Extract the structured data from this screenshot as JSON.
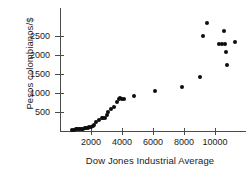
{
  "chart_data": {
    "type": "scatter",
    "title": "",
    "xlabel": "Dow Jones Industrial Average",
    "ylabel": "Pesos colombianos/$",
    "xlim": [
      0,
      12000
    ],
    "ylim": [
      0,
      2900
    ],
    "xticks": [
      2000,
      4000,
      6000,
      8000,
      10000
    ],
    "yticks": [
      500,
      1000,
      1500,
      2000,
      2500
    ],
    "xtick_labels": [
      "2000",
      "4000",
      "6000",
      "8000",
      "10000"
    ],
    "ytick_labels": [
      "500",
      "1000",
      "1500",
      "2000",
      "2500"
    ],
    "grid": false,
    "legend": false,
    "marker": "filled-circle",
    "marker_color": "#0d0d0d",
    "points": [
      {
        "x": 800,
        "y": 30
      },
      {
        "x": 900,
        "y": 35
      },
      {
        "x": 1000,
        "y": 40
      },
      {
        "x": 1100,
        "y": 45
      },
      {
        "x": 1200,
        "y": 50
      },
      {
        "x": 1300,
        "y": 55
      },
      {
        "x": 1400,
        "y": 60
      },
      {
        "x": 1500,
        "y": 65
      },
      {
        "x": 1600,
        "y": 70
      },
      {
        "x": 1700,
        "y": 75
      },
      {
        "x": 1800,
        "y": 85
      },
      {
        "x": 1900,
        "y": 95
      },
      {
        "x": 2000,
        "y": 110
      },
      {
        "x": 2100,
        "y": 130
      },
      {
        "x": 2200,
        "y": 160
      },
      {
        "x": 2300,
        "y": 240
      },
      {
        "x": 2500,
        "y": 300
      },
      {
        "x": 2700,
        "y": 330
      },
      {
        "x": 2800,
        "y": 350
      },
      {
        "x": 2900,
        "y": 345
      },
      {
        "x": 3000,
        "y": 430
      },
      {
        "x": 3100,
        "y": 500
      },
      {
        "x": 3300,
        "y": 580
      },
      {
        "x": 3500,
        "y": 640
      },
      {
        "x": 3700,
        "y": 760
      },
      {
        "x": 3800,
        "y": 840
      },
      {
        "x": 3900,
        "y": 860
      },
      {
        "x": 4000,
        "y": 850
      },
      {
        "x": 4100,
        "y": 845
      },
      {
        "x": 4800,
        "y": 910
      },
      {
        "x": 6100,
        "y": 1050
      },
      {
        "x": 7900,
        "y": 1150
      },
      {
        "x": 9000,
        "y": 1420
      },
      {
        "x": 9250,
        "y": 2500
      },
      {
        "x": 9500,
        "y": 2840
      },
      {
        "x": 10250,
        "y": 2290
      },
      {
        "x": 10450,
        "y": 2300
      },
      {
        "x": 10600,
        "y": 2620
      },
      {
        "x": 10650,
        "y": 2280
      },
      {
        "x": 10700,
        "y": 2080
      },
      {
        "x": 10800,
        "y": 1740
      },
      {
        "x": 11300,
        "y": 2340
      }
    ]
  }
}
